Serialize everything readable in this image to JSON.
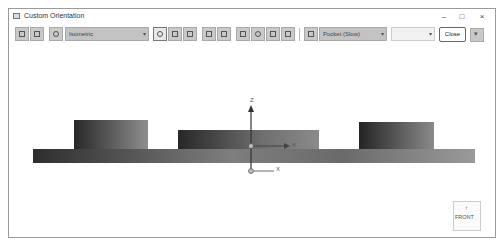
{
  "window": {
    "title": "Custom Orientation",
    "controls": {
      "minimize": "–",
      "maximize": "□",
      "close": "×"
    }
  },
  "toolbar": {
    "view_combo": {
      "value": "Isometric",
      "arrow": "▾"
    },
    "render_combo": {
      "value": "Pocket (Slow)",
      "arrow": "▾"
    },
    "disabled_combo": {
      "value": "",
      "arrow": "▾"
    },
    "close_label": "Close",
    "expand_glyph": "▾"
  },
  "viewport": {
    "triad": {
      "z_label": "Z",
      "x_label": "X",
      "x_label_lower": "X"
    },
    "view_cube": {
      "label": "FRONT",
      "arrow": "↑"
    }
  },
  "colors": {
    "toolbar_button": "#c9c9c9",
    "combo_bg": "#c3c3c3",
    "model_dark": "#3a3a3a",
    "model_light": "#8c8c8c",
    "border": "#9a9a9a"
  }
}
